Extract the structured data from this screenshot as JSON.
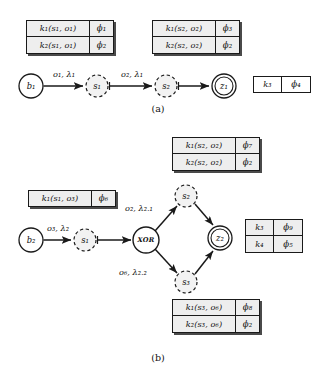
{
  "figure": {
    "width": 323,
    "height": 382,
    "background": "#ffffff",
    "stroke_color": "#1a1a1a",
    "cell_fill": "#eeeeee",
    "captions": [
      {
        "id": "caption-a",
        "label": "(a)",
        "x": 158,
        "y": 108
      },
      {
        "id": "caption-b",
        "label": "(b)",
        "x": 158,
        "y": 357
      }
    ]
  },
  "panel_a": {
    "caption": "(a)",
    "tables": [
      {
        "id": "table-a-left",
        "x": 26,
        "y": 20,
        "key_w": 64,
        "phi_w": 24,
        "row_h": 17,
        "rows": [
          {
            "key": "k₁(s₁, o₁)",
            "phi": "ϕ₁"
          },
          {
            "key": "k₂(s₁, o₁)",
            "phi": "ϕ₂"
          }
        ]
      },
      {
        "id": "table-a-right",
        "x": 152,
        "y": 20,
        "key_w": 64,
        "phi_w": 24,
        "row_h": 17,
        "rows": [
          {
            "key": "k₁(s₂, o₂)",
            "phi": "ϕ₃"
          },
          {
            "key": "k₂(s₂, o₂)",
            "phi": "ϕ₂"
          }
        ]
      },
      {
        "id": "table-a-standalone",
        "x": 253,
        "y": 76,
        "key_w": 29,
        "phi_w": 29,
        "row_h": 17,
        "rows": [
          {
            "key": "k₃",
            "phi": "ϕ₄"
          }
        ]
      }
    ],
    "nodes": [
      {
        "id": "node-b1",
        "label": "b₁",
        "x": 31,
        "y": 86,
        "r": 12,
        "style": "solid"
      },
      {
        "id": "node-s1",
        "label": "s₁",
        "x": 97,
        "y": 86,
        "r": 11,
        "style": "dashed"
      },
      {
        "id": "node-s2",
        "label": "s₂",
        "x": 166,
        "y": 86,
        "r": 11,
        "style": "dashed"
      },
      {
        "id": "node-z1",
        "label": "z₁",
        "x": 224,
        "y": 86,
        "r": 12,
        "style": "double"
      }
    ],
    "edges": [
      {
        "id": "edge-b1-s1",
        "from": "node-b1",
        "to": "node-s1",
        "label": "o₁, λ₁",
        "label_x": 64,
        "label_y": 74
      },
      {
        "id": "edge-s1-s2",
        "from": "node-s1",
        "to": "node-s2",
        "label": "o₂, λ₁",
        "label_x": 132,
        "label_y": 74
      },
      {
        "id": "edge-s2-z1",
        "from": "node-s2",
        "to": "node-z1",
        "label": "",
        "label_x": 0,
        "label_y": 0
      }
    ]
  },
  "panel_b": {
    "caption": "(b)",
    "tables": [
      {
        "id": "table-b-top",
        "x": 172,
        "y": 137,
        "key_w": 64,
        "phi_w": 24,
        "row_h": 17,
        "rows": [
          {
            "key": "k₁(s₂, o₂)",
            "phi": "ϕ₇"
          },
          {
            "key": "k₂(s₂, o₂)",
            "phi": "ϕ₂"
          }
        ]
      },
      {
        "id": "table-b-left",
        "x": 28,
        "y": 190,
        "key_w": 64,
        "phi_w": 24,
        "row_h": 17,
        "rows": [
          {
            "key": "k₁(s₁, o₃)",
            "phi": "ϕ₆"
          }
        ]
      },
      {
        "id": "table-b-right",
        "x": 245,
        "y": 219,
        "key_w": 29,
        "phi_w": 29,
        "row_h": 17,
        "rows": [
          {
            "key": "k₃",
            "phi": "ϕ₉"
          },
          {
            "key": "k₄",
            "phi": "ϕ₅"
          }
        ]
      },
      {
        "id": "table-b-bottom",
        "x": 172,
        "y": 299,
        "key_w": 64,
        "phi_w": 24,
        "row_h": 17,
        "rows": [
          {
            "key": "k₁(s₃, o₆)",
            "phi": "ϕ₈"
          },
          {
            "key": "k₂(s₃, o₆)",
            "phi": "ϕ₂"
          }
        ]
      }
    ],
    "nodes": [
      {
        "id": "node-b2",
        "label": "b₂",
        "x": 31,
        "y": 240,
        "r": 12,
        "style": "solid"
      },
      {
        "id": "node-s1b",
        "label": "s₁",
        "x": 85,
        "y": 240,
        "r": 11,
        "style": "dashed"
      },
      {
        "id": "node-xor",
        "label": "XOR",
        "x": 146,
        "y": 240,
        "r": 13,
        "style": "solid"
      },
      {
        "id": "node-s2b",
        "label": "s₂",
        "x": 186,
        "y": 196,
        "r": 11,
        "style": "dashed"
      },
      {
        "id": "node-s3b",
        "label": "s₃",
        "x": 186,
        "y": 282,
        "r": 11,
        "style": "dashed"
      },
      {
        "id": "node-z2",
        "label": "z₂",
        "x": 220,
        "y": 238,
        "r": 12,
        "style": "double"
      }
    ],
    "edges": [
      {
        "id": "edge-b2-s1b",
        "from": "node-b2",
        "to": "node-s1b",
        "label": "o₃, λ₂",
        "label_x": 58,
        "label_y": 228
      },
      {
        "id": "edge-s1b-xor",
        "from": "node-s1b",
        "to": "node-xor",
        "label": "",
        "label_x": 0,
        "label_y": 0
      },
      {
        "id": "edge-xor-s2b",
        "from": "node-xor",
        "to": "node-s2b",
        "label": "o₂, λ₂.₁",
        "label_x": 139,
        "label_y": 208
      },
      {
        "id": "edge-xor-s3b",
        "from": "node-xor",
        "to": "node-s3b",
        "label": "o₆, λ₂.₂",
        "label_x": 133,
        "label_y": 272
      },
      {
        "id": "edge-s2b-z2",
        "from": "node-s2b",
        "to": "node-z2",
        "label": "",
        "label_x": 0,
        "label_y": 0
      },
      {
        "id": "edge-s3b-z2",
        "from": "node-s3b",
        "to": "node-z2",
        "label": "",
        "label_x": 0,
        "label_y": 0
      }
    ]
  }
}
